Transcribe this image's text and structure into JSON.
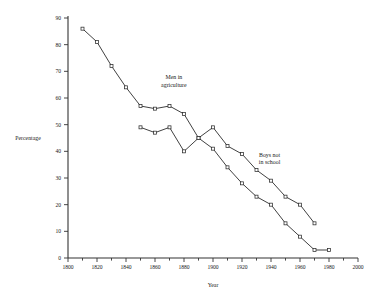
{
  "chart_data": {
    "type": "line",
    "title": "",
    "xlabel": "Year",
    "ylabel": "Percentage",
    "xlim": [
      1800,
      2000
    ],
    "ylim": [
      0,
      90
    ],
    "xticks": [
      1800,
      1820,
      1840,
      1860,
      1880,
      1900,
      1920,
      1940,
      1960,
      1980,
      2000
    ],
    "xticklabels": [
      "1800",
      "1820",
      "1840",
      "1860",
      "1880",
      "1900",
      "1920",
      "1940",
      "1960",
      "1980",
      "2000"
    ],
    "xminorticks": [
      1810,
      1830,
      1850,
      1870,
      1890,
      1910,
      1930,
      1950,
      1970,
      1990
    ],
    "yticks": [
      0,
      10,
      20,
      30,
      40,
      50,
      60,
      70,
      80,
      90
    ],
    "yticklabels": [
      "0",
      "10",
      "20",
      "30",
      "40",
      "50",
      "60",
      "70",
      "80",
      "90"
    ],
    "grid": false,
    "legend": "annotations-inline",
    "marker": "open-square",
    "series": [
      {
        "name": "Men in agriculture",
        "x": [
          1810,
          1820,
          1830,
          1840,
          1850,
          1860,
          1870,
          1880,
          1890,
          1900,
          1910,
          1920,
          1930,
          1940,
          1950,
          1960,
          1970,
          1980
        ],
        "y": [
          86,
          81,
          72,
          64,
          57,
          56,
          57,
          54,
          45,
          41,
          34,
          28,
          23,
          20,
          13,
          8,
          3,
          3
        ]
      },
      {
        "name": "Boys not in school",
        "x": [
          1850,
          1860,
          1870,
          1880,
          1890,
          1900,
          1910,
          1920,
          1930,
          1940,
          1950,
          1960,
          1970
        ],
        "y": [
          49,
          47,
          49,
          40,
          45,
          49,
          42,
          39,
          33,
          29,
          23,
          20,
          13
        ]
      }
    ],
    "annotations": [
      {
        "name": "Men in agriculture",
        "text_lines": [
          "Men in",
          "agriculture"
        ],
        "x": 1873,
        "y": 67
      },
      {
        "name": "Boys not in school",
        "text_lines": [
          "Boys not",
          "in school"
        ],
        "x": 1939,
        "y": 38
      }
    ]
  }
}
